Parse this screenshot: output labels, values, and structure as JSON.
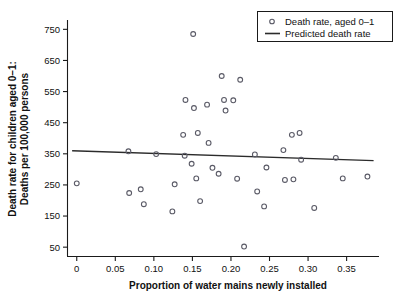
{
  "chart_data": {
    "type": "scatter",
    "title": "",
    "xlabel": "Proportion of water mains newly installed",
    "ylabel_line1": "Death rate for children aged 0–1:",
    "ylabel_line2": "Deaths per 100,000 persons",
    "xlim": [
      -0.012,
      0.392
    ],
    "ylim": [
      20,
      780
    ],
    "xticks": [
      0,
      0.05,
      0.1,
      0.15,
      0.2,
      0.25,
      0.3,
      0.35
    ],
    "xticklabels": [
      "0",
      "0.05",
      "0.10",
      "0.15",
      "0.20",
      "0.25",
      "0.30",
      "0.35"
    ],
    "yticks": [
      50,
      150,
      250,
      350,
      450,
      550,
      650,
      750
    ],
    "yticklabels": [
      "50",
      "150",
      "250",
      "350",
      "450",
      "550",
      "650",
      "750"
    ],
    "grid": false,
    "legend_position": "top-right",
    "legend": [
      {
        "label": "Death rate, aged 0–1",
        "marker": "open-circle",
        "color": "#5a5a66"
      },
      {
        "label": "Predicted death rate",
        "marker": "line",
        "color": "#2b2b2b"
      }
    ],
    "series": [
      {
        "name": "Death rate, aged 0–1",
        "marker": "open-circle",
        "color": "#5a5a66",
        "points": [
          [
            0.0,
            255
          ],
          [
            0.067,
            358
          ],
          [
            0.068,
            224
          ],
          [
            0.083,
            236
          ],
          [
            0.087,
            188
          ],
          [
            0.103,
            349
          ],
          [
            0.124,
            165
          ],
          [
            0.127,
            252
          ],
          [
            0.138,
            411
          ],
          [
            0.14,
            344
          ],
          [
            0.141,
            523
          ],
          [
            0.149,
            318
          ],
          [
            0.151,
            735
          ],
          [
            0.152,
            497
          ],
          [
            0.155,
            271
          ],
          [
            0.157,
            417
          ],
          [
            0.16,
            198
          ],
          [
            0.169,
            508
          ],
          [
            0.171,
            385
          ],
          [
            0.176,
            305
          ],
          [
            0.184,
            286
          ],
          [
            0.188,
            600
          ],
          [
            0.191,
            523
          ],
          [
            0.193,
            489
          ],
          [
            0.203,
            522
          ],
          [
            0.208,
            270
          ],
          [
            0.212,
            588
          ],
          [
            0.217,
            52
          ],
          [
            0.231,
            348
          ],
          [
            0.234,
            229
          ],
          [
            0.243,
            181
          ],
          [
            0.246,
            306
          ],
          [
            0.268,
            362
          ],
          [
            0.27,
            266
          ],
          [
            0.279,
            411
          ],
          [
            0.281,
            268
          ],
          [
            0.289,
            417
          ],
          [
            0.291,
            331
          ],
          [
            0.308,
            176
          ],
          [
            0.336,
            337
          ],
          [
            0.345,
            271
          ],
          [
            0.377,
            277
          ]
        ]
      }
    ],
    "fit_line": {
      "name": "Predicted death rate",
      "color": "#2b2b2b",
      "x": [
        -0.006,
        0.385
      ],
      "y": [
        360,
        328
      ]
    }
  }
}
